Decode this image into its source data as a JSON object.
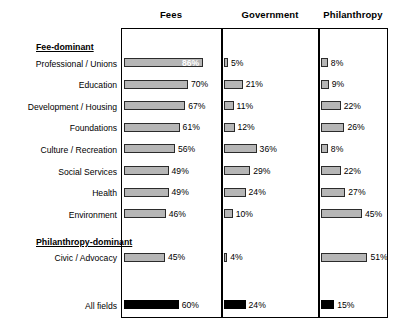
{
  "chart_data": {
    "type": "bar",
    "title": "",
    "xlabel": "",
    "ylabel": "",
    "orientation": "horizontal",
    "xlim": [
      0,
      100
    ],
    "grid": false,
    "legend": "none",
    "value_suffix": "%",
    "panels": [
      "Fees",
      "Government",
      "Philanthropy"
    ],
    "sections": [
      {
        "label": "Fee-dominant",
        "categories": [
          "Professional / Unions",
          "Education",
          "Development / Housing",
          "Foundations",
          "Culture / Recreation",
          "Social Services",
          "Health",
          "Environment"
        ],
        "series": [
          {
            "name": "Fees",
            "values": [
              86,
              70,
              67,
              61,
              56,
              49,
              49,
              46
            ]
          },
          {
            "name": "Government",
            "values": [
              5,
              21,
              11,
              12,
              36,
              29,
              24,
              10
            ]
          },
          {
            "name": "Philanthropy",
            "values": [
              8,
              9,
              22,
              26,
              8,
              22,
              27,
              45
            ]
          }
        ]
      },
      {
        "label": "Philanthropy-dominant",
        "categories": [
          "Civic / Advocacy"
        ],
        "series": [
          {
            "name": "Fees",
            "values": [
              45
            ]
          },
          {
            "name": "Government",
            "values": [
              4
            ]
          },
          {
            "name": "Philanthropy",
            "values": [
              51
            ]
          }
        ]
      }
    ],
    "summary": {
      "label": "All fields",
      "series": [
        {
          "name": "Fees",
          "values": [
            60
          ]
        },
        {
          "name": "Government",
          "values": [
            24
          ]
        },
        {
          "name": "Philanthropy",
          "values": [
            15
          ]
        }
      ]
    },
    "colors": {
      "bar_fill": "#b6b6b6",
      "bar_edge": "#2b2b2b",
      "summary_fill": "#000000",
      "frame": "#000000"
    }
  }
}
